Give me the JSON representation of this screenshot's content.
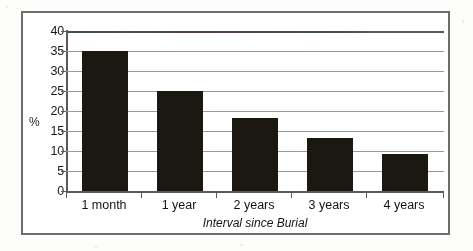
{
  "chart_data": {
    "type": "bar",
    "title": "",
    "xlabel": "Interval since Burial",
    "ylabel": "%",
    "categories": [
      "1 month",
      "1 year",
      "2 years",
      "3 years",
      "4 years"
    ],
    "values": [
      35,
      25,
      18.3,
      13.3,
      9.5
    ],
    "ylim": [
      0,
      40
    ],
    "ytick_labels": [
      "40",
      "35",
      "30",
      "25",
      "20",
      "15",
      "10",
      "5",
      "0"
    ],
    "ytick_values": [
      40,
      35,
      30,
      25,
      20,
      15,
      10,
      5,
      0
    ],
    "grid": true,
    "legend": false,
    "bar_color": "#1b1811",
    "axis_color": "#5a5a5a",
    "grid_color": "#9a9a9a",
    "frame_color": "#6d6d6d",
    "background": "#ffffff"
  }
}
